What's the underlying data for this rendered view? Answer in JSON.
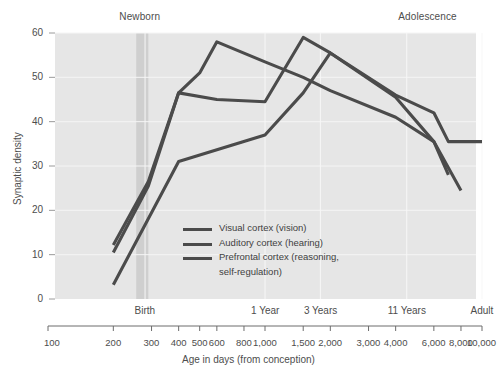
{
  "chart_data": {
    "type": "line",
    "title": "",
    "xlabel": "Age in days (from conception)",
    "ylabel": "Synaptic density",
    "xscale": "log",
    "xlim": [
      100,
      10000
    ],
    "ylim": [
      0,
      60
    ],
    "grid": true,
    "legend_position": "center",
    "x_ticks": [
      {
        "value": 100,
        "label": "100"
      },
      {
        "value": 200,
        "label": "200"
      },
      {
        "value": 300,
        "label": "300"
      },
      {
        "value": 400,
        "label": "400"
      },
      {
        "value": 500,
        "label": "500"
      },
      {
        "value": 600,
        "label": "600"
      },
      {
        "value": 800,
        "label": "800"
      },
      {
        "value": 1000,
        "label": "1,000"
      },
      {
        "value": 1500,
        "label": "1,500"
      },
      {
        "value": 2000,
        "label": "2,000"
      },
      {
        "value": 3000,
        "label": "3,000"
      },
      {
        "value": 4000,
        "label": "4,000"
      },
      {
        "value": 6000,
        "label": "6,000"
      },
      {
        "value": 8000,
        "label": "8,000"
      },
      {
        "value": 10000,
        "label": "10,000"
      }
    ],
    "y_ticks": [
      {
        "value": 0,
        "label": "0"
      },
      {
        "value": 10,
        "label": "10"
      },
      {
        "value": 20,
        "label": "20"
      },
      {
        "value": 30,
        "label": "30"
      },
      {
        "value": 40,
        "label": "40"
      },
      {
        "value": 50,
        "label": "50"
      },
      {
        "value": 60,
        "label": "60"
      }
    ],
    "stage_markers": [
      {
        "value": 280,
        "label": "Birth"
      },
      {
        "value": 1000,
        "label": "1 Year"
      },
      {
        "value": 1800,
        "label": "3 Years"
      },
      {
        "value": 4500,
        "label": "11 Years"
      },
      {
        "value": 10000,
        "label": "Adult"
      }
    ],
    "era_annotations": [
      {
        "label": "Newborn",
        "value": 265
      },
      {
        "label": "Adolescence",
        "value": 5600
      }
    ],
    "highlight_band": {
      "from": 255,
      "to": 290,
      "label": "Newborn"
    },
    "series": [
      {
        "name": "Visual cortex (vision)",
        "color": "#4b4b4b",
        "points": [
          [
            200,
            12.2
          ],
          [
            290,
            26.5
          ],
          [
            400,
            46.5
          ],
          [
            500,
            51.0
          ],
          [
            600,
            58.0
          ],
          [
            1000,
            53.5
          ],
          [
            1500,
            50.0
          ],
          [
            2000,
            47.0
          ],
          [
            4000,
            41.0
          ],
          [
            6000,
            35.5
          ],
          [
            8000,
            24.5
          ]
        ]
      },
      {
        "name": "Auditory cortex (hearing)",
        "color": "#4b4b4b",
        "points": [
          [
            200,
            10.5
          ],
          [
            290,
            25.5
          ],
          [
            400,
            46.5
          ],
          [
            600,
            45.0
          ],
          [
            1000,
            44.5
          ],
          [
            1500,
            59.0
          ],
          [
            2000,
            55.5
          ],
          [
            4000,
            45.5
          ],
          [
            6000,
            35.5
          ],
          [
            7000,
            28.0
          ]
        ]
      },
      {
        "name": "Prefrontal cortex (reasoning, self-regulation)",
        "color": "#4b4b4b",
        "points": [
          [
            200,
            3.2
          ],
          [
            400,
            31.0
          ],
          [
            1000,
            37.0
          ],
          [
            1500,
            46.5
          ],
          [
            2000,
            55.5
          ],
          [
            4000,
            46.0
          ],
          [
            6000,
            42.0
          ],
          [
            7000,
            35.5
          ],
          [
            10000,
            35.5
          ]
        ]
      }
    ]
  },
  "legend": {
    "items": [
      {
        "label": "Visual cortex (vision)"
      },
      {
        "label": "Auditory cortex (hearing)"
      },
      {
        "label": "Prefrontal cortex (reasoning,"
      },
      {
        "label": "self-regulation)"
      }
    ]
  }
}
